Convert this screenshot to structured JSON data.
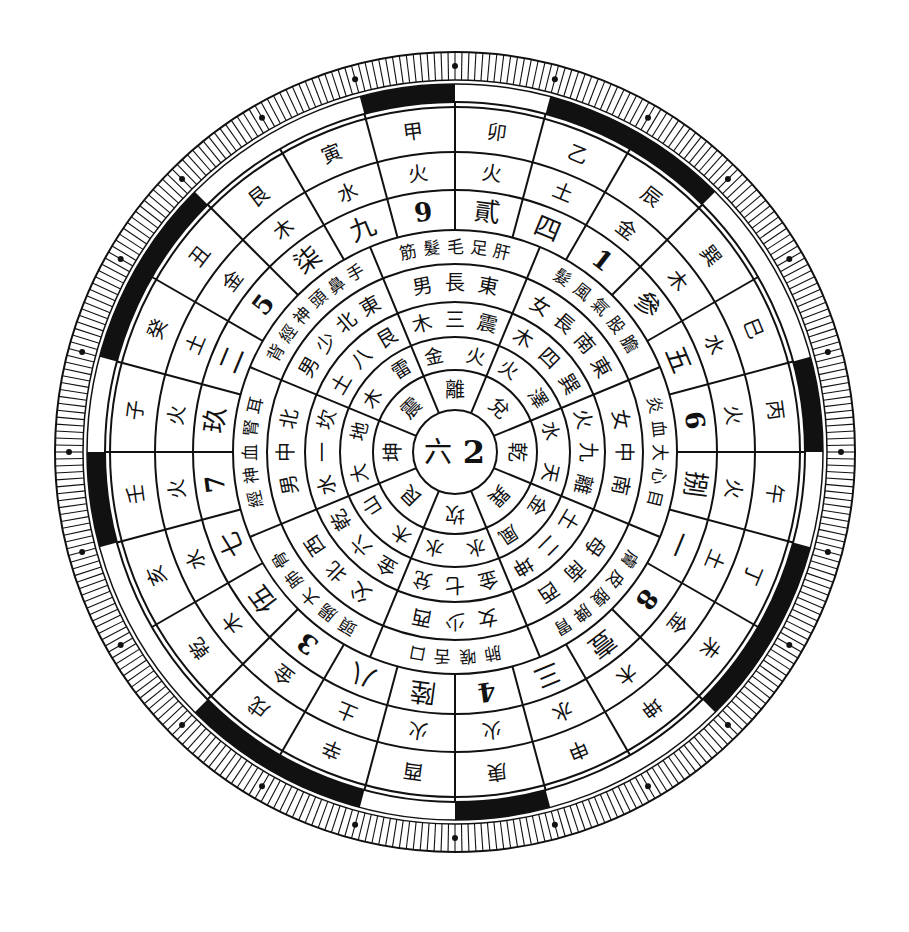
{
  "diagram": {
    "type": "circular-compass",
    "center": {
      "x": 455,
      "y": 452
    },
    "colors": {
      "ink": "#111111",
      "paper": "#ffffff"
    },
    "hub": {
      "labels": [
        "六",
        "2"
      ]
    },
    "rings": {
      "r_hub": 42,
      "r1": 82,
      "r2": 115,
      "r3": 150,
      "r4": 188,
      "r5": 222,
      "r6": 262,
      "r7": 300,
      "r8": 345,
      "r_band_in": 350,
      "r_band_out": 368,
      "r_tick_out": 400
    },
    "ring_trigram": [
      {
        "angle": 0,
        "text": "乾"
      },
      {
        "angle": 45,
        "text": "巽"
      },
      {
        "angle": 90,
        "text": "坎"
      },
      {
        "angle": 135,
        "text": "艮"
      },
      {
        "angle": 180,
        "text": "坤"
      },
      {
        "angle": 225,
        "text": "震"
      },
      {
        "angle": 270,
        "text": "離"
      },
      {
        "angle": 315,
        "text": "兌"
      }
    ],
    "ring_element_pairs": [
      {
        "angle": 0,
        "text": "天水"
      },
      {
        "angle": 45,
        "text": "風金"
      },
      {
        "angle": 90,
        "text": "水水"
      },
      {
        "angle": 135,
        "text": "山木"
      },
      {
        "angle": 180,
        "text": "地大"
      },
      {
        "angle": 225,
        "text": "雷木"
      },
      {
        "angle": 270,
        "text": "火金"
      },
      {
        "angle": 315,
        "text": "澤火"
      }
    ],
    "ring_trigram_number": [
      {
        "angle": 0,
        "text": "離九火"
      },
      {
        "angle": 45,
        "text": "坤二土"
      },
      {
        "angle": 90,
        "text": "兌七金"
      },
      {
        "angle": 135,
        "text": "乾六金"
      },
      {
        "angle": 180,
        "text": "坎一水"
      },
      {
        "angle": 225,
        "text": "艮八土"
      },
      {
        "angle": 270,
        "text": "震三木"
      },
      {
        "angle": 315,
        "text": "巽四木"
      }
    ],
    "ring_direction_family": [
      {
        "angle": 0,
        "text": "南中女"
      },
      {
        "angle": 45,
        "text": "西南母"
      },
      {
        "angle": 90,
        "text": "西少女"
      },
      {
        "angle": 135,
        "text": "西北父"
      },
      {
        "angle": 180,
        "text": "北中男"
      },
      {
        "angle": 225,
        "text": "東北少男"
      },
      {
        "angle": 270,
        "text": "東長男"
      },
      {
        "angle": 315,
        "text": "東南長女"
      }
    ],
    "ring_body": [
      {
        "angle": 0,
        "text": "目心大血炎"
      },
      {
        "angle": 45,
        "text": "胃脾腹皮膚"
      },
      {
        "angle": 90,
        "text": "口舌喉肺"
      },
      {
        "angle": 135,
        "text": "骨肺大腸頭"
      },
      {
        "angle": 180,
        "text": "耳腎血神經"
      },
      {
        "angle": 225,
        "text": "手鼻頭神經背"
      },
      {
        "angle": 270,
        "text": "肝足毛髮筋"
      },
      {
        "angle": 315,
        "text": "膽股氣風髮"
      }
    ],
    "ring_numbers": [
      {
        "angle": 352.5,
        "text": "6"
      },
      {
        "angle": 7.5,
        "text": "捌"
      },
      {
        "angle": 22.5,
        "text": "一"
      },
      {
        "angle": 37.5,
        "text": "8"
      },
      {
        "angle": 52.5,
        "text": "壹"
      },
      {
        "angle": 67.5,
        "text": "三"
      },
      {
        "angle": 82.5,
        "text": "4"
      },
      {
        "angle": 97.5,
        "text": "陸"
      },
      {
        "angle": 112.5,
        "text": "八"
      },
      {
        "angle": 127.5,
        "text": "3"
      },
      {
        "angle": 142.5,
        "text": "伍"
      },
      {
        "angle": 157.5,
        "text": "七"
      },
      {
        "angle": 172.5,
        "text": "7"
      },
      {
        "angle": 187.5,
        "text": "玖"
      },
      {
        "angle": 202.5,
        "text": "二"
      },
      {
        "angle": 217.5,
        "text": "5"
      },
      {
        "angle": 232.5,
        "text": "柒"
      },
      {
        "angle": 247.5,
        "text": "九"
      },
      {
        "angle": 262.5,
        "text": "9"
      },
      {
        "angle": 277.5,
        "text": "貳"
      },
      {
        "angle": 292.5,
        "text": "四"
      },
      {
        "angle": 307.5,
        "text": "1"
      },
      {
        "angle": 322.5,
        "text": "參"
      },
      {
        "angle": 337.5,
        "text": "五"
      }
    ],
    "ring_elements": [
      {
        "angle": 352.5,
        "text": "火"
      },
      {
        "angle": 7.5,
        "text": "火"
      },
      {
        "angle": 22.5,
        "text": "土"
      },
      {
        "angle": 37.5,
        "text": "金"
      },
      {
        "angle": 52.5,
        "text": "木"
      },
      {
        "angle": 67.5,
        "text": "水"
      },
      {
        "angle": 82.5,
        "text": "火"
      },
      {
        "angle": 97.5,
        "text": "火"
      },
      {
        "angle": 112.5,
        "text": "土"
      },
      {
        "angle": 127.5,
        "text": "金"
      },
      {
        "angle": 142.5,
        "text": "木"
      },
      {
        "angle": 157.5,
        "text": "水"
      },
      {
        "angle": 172.5,
        "text": "火"
      },
      {
        "angle": 187.5,
        "text": "火"
      },
      {
        "angle": 202.5,
        "text": "土"
      },
      {
        "angle": 217.5,
        "text": "金"
      },
      {
        "angle": 232.5,
        "text": "木"
      },
      {
        "angle": 247.5,
        "text": "水"
      },
      {
        "angle": 262.5,
        "text": "火"
      },
      {
        "angle": 277.5,
        "text": "火"
      },
      {
        "angle": 292.5,
        "text": "土"
      },
      {
        "angle": 307.5,
        "text": "金"
      },
      {
        "angle": 322.5,
        "text": "木"
      },
      {
        "angle": 337.5,
        "text": "水"
      }
    ],
    "ring_mountains": [
      {
        "angle": 352.5,
        "text": "丙"
      },
      {
        "angle": 7.5,
        "text": "午"
      },
      {
        "angle": 22.5,
        "text": "丁"
      },
      {
        "angle": 37.5,
        "text": "未"
      },
      {
        "angle": 52.5,
        "text": "坤"
      },
      {
        "angle": 67.5,
        "text": "申"
      },
      {
        "angle": 82.5,
        "text": "庚"
      },
      {
        "angle": 97.5,
        "text": "酉"
      },
      {
        "angle": 112.5,
        "text": "辛"
      },
      {
        "angle": 127.5,
        "text": "戌"
      },
      {
        "angle": 142.5,
        "text": "乾"
      },
      {
        "angle": 157.5,
        "text": "亥"
      },
      {
        "angle": 172.5,
        "text": "壬"
      },
      {
        "angle": 187.5,
        "text": "子"
      },
      {
        "angle": 202.5,
        "text": "癸"
      },
      {
        "angle": 217.5,
        "text": "丑"
      },
      {
        "angle": 232.5,
        "text": "艮"
      },
      {
        "angle": 247.5,
        "text": "寅"
      },
      {
        "angle": 262.5,
        "text": "甲"
      },
      {
        "angle": 277.5,
        "text": "卯"
      },
      {
        "angle": 292.5,
        "text": "乙"
      },
      {
        "angle": 307.5,
        "text": "辰"
      },
      {
        "angle": 322.5,
        "text": "巽"
      },
      {
        "angle": 337.5,
        "text": "巳"
      }
    ],
    "black_band_segments": [
      {
        "from": 345,
        "to": 0
      },
      {
        "from": 15,
        "to": 45
      },
      {
        "from": 75,
        "to": 90
      },
      {
        "from": 105,
        "to": 135
      },
      {
        "from": 165,
        "to": 180
      },
      {
        "from": 195,
        "to": 225
      },
      {
        "from": 255,
        "to": 270
      },
      {
        "from": 285,
        "to": 315
      }
    ],
    "tick_count": 360,
    "dot_marker_count": 24
  }
}
